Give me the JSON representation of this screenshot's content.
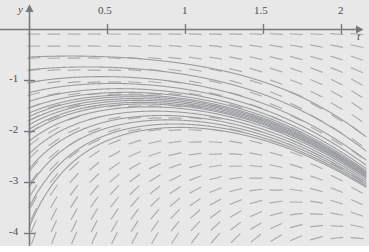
{
  "figure": {
    "kind": "slope-field-with-solution-curves",
    "background_color": "#e8e8e8",
    "page_color": "#ffffff",
    "axis_color": "#77787a",
    "tick_color": "#77787a",
    "segment_color": "#a9abad",
    "curve_color": "#9a9c9e",
    "label_color": "#4d4d4d"
  },
  "axes": {
    "x_axis_name": "t",
    "y_axis_name": "y",
    "x_ticks": [
      {
        "value": 0.5,
        "label": "0.5",
        "px": 107
      },
      {
        "value": 1,
        "label": "1",
        "px": 185
      },
      {
        "value": 1.5,
        "label": "1.5",
        "px": 263
      },
      {
        "value": 2,
        "label": "2",
        "px": 341
      }
    ],
    "y_ticks": [
      {
        "value": -1,
        "label": "-1",
        "px": 80
      },
      {
        "value": -2,
        "label": "-2",
        "px": 131
      },
      {
        "value": -3,
        "label": "-3",
        "px": 182
      },
      {
        "value": -4,
        "label": "-4",
        "px": 233
      }
    ],
    "origin_px": {
      "x": 29,
      "y": 29
    },
    "x_axis_arrow": true,
    "y_axis_arrow": true
  },
  "chart_data": {
    "type": "line",
    "title": "",
    "xlabel": "t",
    "ylabel": "y",
    "xlim": [
      -0.09,
      2.14
    ],
    "ylim": [
      -4.25,
      0.18
    ],
    "grid": false,
    "legend": "none",
    "plot_kind": "slope field (direction field) with integral curves",
    "slope_field": {
      "description": "Short line segments showing dy/dt on a grid; slopes are positive (rising to the right) in the upper-left of the window and become increasingly steeply negative toward the lower-right.",
      "slope_formula": "dy/dt = t*y + y*y/2",
      "grid_t_start": 0.03,
      "grid_t_step": 0.1295,
      "grid_t_count": 17,
      "grid_y_start": -0.1,
      "grid_y_step": -0.2353,
      "grid_y_count": 18,
      "segment_length_px": 13
    },
    "solution_curves": {
      "description": "A family of solution curves emanating from near (0, -1.7); upper members rise toward the t-axis and flatten, lower members turn down and plunge off the bottom of the frame.",
      "common_origin": {
        "t": 0.0,
        "y": -1.7
      },
      "initial_values_y0": [
        -0.55,
        -0.8,
        -1.05,
        -1.25,
        -1.42,
        -1.55,
        -1.65,
        -1.72,
        -1.8,
        -1.88,
        -1.97,
        -2.05,
        -2.2,
        -2.45,
        -2.75,
        -3.1,
        -3.5,
        -3.9
      ],
      "count": 18
    }
  }
}
